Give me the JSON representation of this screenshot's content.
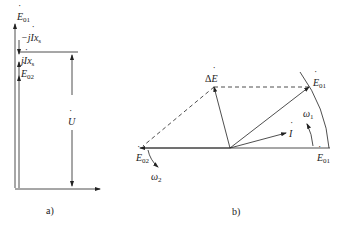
{
  "figure_a": {
    "caption": "a)",
    "labels": {
      "e01": {
        "main": "E",
        "sub": "01"
      },
      "minus_jix": {
        "prefix": "−j",
        "main": "I",
        "rest": "x",
        "sub": "s"
      },
      "jix": {
        "prefix": "j",
        "main": "I",
        "rest": "x",
        "sub": "s"
      },
      "e02": {
        "main": "E",
        "sub": "02"
      },
      "u": {
        "main": "U"
      }
    }
  },
  "figure_b": {
    "caption": "b)",
    "labels": {
      "delta_e": {
        "prefix": "Δ",
        "main": "E"
      },
      "e01_rotated": {
        "main": "E",
        "sub": "01"
      },
      "omega1": {
        "main": "ω",
        "sub": "1"
      },
      "i": {
        "main": "I"
      },
      "e02": {
        "main": "E",
        "sub": "02"
      },
      "omega2": {
        "main": "ω",
        "sub": "2"
      },
      "e01": {
        "main": "E",
        "sub": "01"
      }
    }
  }
}
